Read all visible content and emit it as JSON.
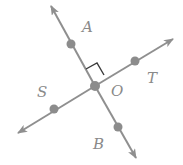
{
  "diagram": {
    "colors": {
      "line": "#8f8f8f",
      "point": "#8c8c8c",
      "label": "#8a8a8a",
      "right_angle_mark": "#3a3a3a",
      "background": "#ffffff"
    },
    "labels": {
      "A": "A",
      "T": "T",
      "S": "S",
      "O": "O",
      "B": "B"
    },
    "points": [
      {
        "name": "A",
        "x": 71,
        "y": 44
      },
      {
        "name": "T",
        "x": 135,
        "y": 61
      },
      {
        "name": "S",
        "x": 54,
        "y": 109
      },
      {
        "name": "O",
        "x": 95,
        "y": 86
      },
      {
        "name": "B",
        "x": 118,
        "y": 127
      }
    ],
    "lines": [
      {
        "name": "line-AB",
        "from": "arrow-up-left",
        "to": "arrow-down-right",
        "through": [
          "A",
          "O",
          "B"
        ]
      },
      {
        "name": "line-ST",
        "from": "arrow-down-left",
        "to": "arrow-up-right",
        "through": [
          "S",
          "O",
          "T"
        ]
      }
    ],
    "right_angle": {
      "vertex": "O",
      "between": [
        "A",
        "T"
      ]
    }
  }
}
